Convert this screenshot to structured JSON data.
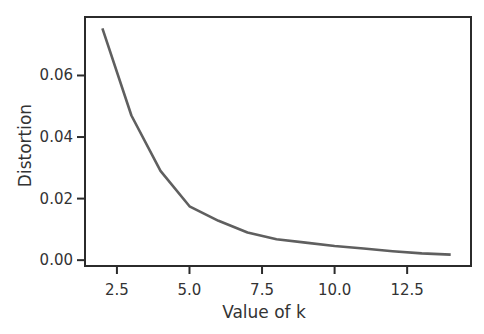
{
  "chart_data": {
    "type": "line",
    "title": "",
    "xlabel": "Value of k",
    "ylabel": "Distortion",
    "x": [
      2,
      3,
      4,
      5,
      6,
      7,
      8,
      9,
      10,
      11,
      12,
      13,
      14
    ],
    "series": [
      {
        "name": "Distortion",
        "values": [
          0.0753,
          0.047,
          0.029,
          0.0175,
          0.0128,
          0.009,
          0.0068,
          0.0057,
          0.0046,
          0.0038,
          0.0029,
          0.0022,
          0.0018
        ],
        "color": "#5f5f5f"
      }
    ],
    "xticks": [
      2.5,
      5.0,
      7.5,
      10.0,
      12.5
    ],
    "xtick_labels": [
      "2.5",
      "5.0",
      "7.5",
      "10.0",
      "12.5"
    ],
    "yticks": [
      0.0,
      0.02,
      0.04,
      0.06
    ],
    "ytick_labels": [
      "0.00",
      "0.02",
      "0.04",
      "0.06"
    ],
    "xlim": [
      1.4,
      14.7
    ],
    "ylim": [
      -0.0019,
      0.079
    ],
    "grid": false,
    "legend": null
  },
  "layout": {
    "plot_left": 85,
    "plot_top": 17,
    "plot_right": 471,
    "plot_bottom": 266,
    "axis_color": "#2b2b2b",
    "line_color": "#5f5f5f"
  }
}
